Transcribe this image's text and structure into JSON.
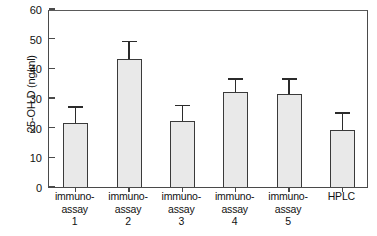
{
  "chart_data": {
    "type": "bar",
    "title": "",
    "xlabel": "",
    "ylabel": "25-OH D (ng/ml)",
    "ylim": [
      0,
      60
    ],
    "yticks": [
      0,
      10,
      20,
      30,
      40,
      50,
      60
    ],
    "grid": false,
    "legend": null,
    "error_bars": "upper-only",
    "categories": [
      "immuno-assay 1",
      "immuno-assay 2",
      "immuno-assay 3",
      "immuno-assay 4",
      "immuno-assay 5",
      "HPLC"
    ],
    "category_lines": [
      [
        "immuno-",
        "assay",
        "1"
      ],
      [
        "immuno-",
        "assay",
        "2"
      ],
      [
        "immuno-",
        "assay",
        "3"
      ],
      [
        "immuno-",
        "assay",
        "4"
      ],
      [
        "immuno-",
        "assay",
        "5"
      ],
      [
        "HPLC",
        "",
        ""
      ]
    ],
    "values": [
      21.5,
      43.0,
      22.2,
      32.0,
      31.5,
      19.3
    ],
    "error_upper": [
      27.0,
      49.0,
      27.5,
      36.5,
      36.5,
      25.0
    ],
    "colors": {
      "bar_fill": "#e9e9e9",
      "bar_edge": "#3a3a3a",
      "axis": "#4a4a4a",
      "text": "#111111",
      "background": "#ffffff"
    }
  }
}
